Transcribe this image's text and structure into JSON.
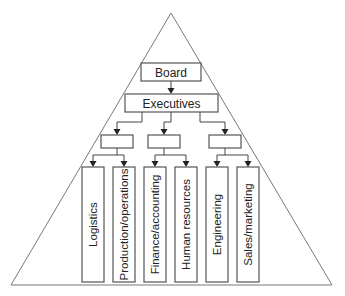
{
  "diagram": {
    "type": "organizational-pyramid",
    "shape": "triangle",
    "nodes": {
      "board": {
        "label": "Board"
      },
      "executives": {
        "label": "Executives"
      },
      "managers": [
        {
          "label": ""
        },
        {
          "label": ""
        },
        {
          "label": ""
        }
      ],
      "departments": [
        {
          "label": "Logistics",
          "group": 0
        },
        {
          "label": "Production/operations",
          "group": 0
        },
        {
          "label": "Finance/accounting",
          "group": 1
        },
        {
          "label": "Human resources",
          "group": 1
        },
        {
          "label": "Engineering",
          "group": 2
        },
        {
          "label": "Sales/marketing",
          "group": 2
        }
      ]
    },
    "edges": [
      [
        "Board",
        "Executives"
      ],
      [
        "Executives",
        "manager-1"
      ],
      [
        "Executives",
        "manager-2"
      ],
      [
        "Executives",
        "manager-3"
      ],
      [
        "manager-1",
        "Logistics"
      ],
      [
        "manager-1",
        "Production/operations"
      ],
      [
        "manager-2",
        "Finance/accounting"
      ],
      [
        "manager-2",
        "Human resources"
      ],
      [
        "manager-3",
        "Engineering"
      ],
      [
        "manager-3",
        "Sales/marketing"
      ]
    ]
  }
}
